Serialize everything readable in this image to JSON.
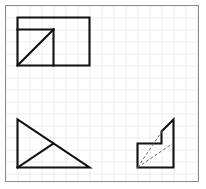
{
  "figure": {
    "canvas": {
      "width": 206,
      "height": 189,
      "background": "#ffffff"
    },
    "grid": {
      "visible": true,
      "cell_size": 12,
      "line_color": "#c9c9cf",
      "line_width": 0.7,
      "origin_x": 5.5,
      "origin_y": 5.5,
      "columns": 16,
      "rows": 14.5
    },
    "border": {
      "color": "#8a8a92",
      "width": 1,
      "x": 5.5,
      "y": 5.5,
      "w": 193,
      "h": 176
    },
    "stroke": {
      "color": "#111111",
      "width": 2.1,
      "dash_color": "#666666",
      "dash_width": 1,
      "dash_pattern": "3,2.2"
    },
    "shapes": [
      {
        "name": "rectangle-with-inner-square-and-diagonal",
        "position": "top-left",
        "outline": "17.5,17.5 89.5,17.5 89.5,65.5 17.5,65.5",
        "inner_lines": [
          {
            "name": "inner-square-top",
            "x1": 17.5,
            "y1": 29.5,
            "x2": 53.5,
            "y2": 29.5
          },
          {
            "name": "inner-square-right",
            "x1": 53.5,
            "y1": 29.5,
            "x2": 53.5,
            "y2": 65.5
          },
          {
            "name": "inner-square-diagonal",
            "x1": 17.5,
            "y1": 65.5,
            "x2": 53.5,
            "y2": 29.5
          }
        ]
      },
      {
        "name": "right-triangle-with-cevian",
        "position": "bottom-left",
        "outline": "17.5,119.5 17.5,167.5 89.5,167.5",
        "inner_lines": [
          {
            "name": "triangle-hypotenuse",
            "x1": 17.5,
            "y1": 119.5,
            "x2": 89.5,
            "y2": 167.5
          },
          {
            "name": "triangle-cevian",
            "x1": 17.5,
            "y1": 167.5,
            "x2": 53.5,
            "y2": 143.5
          }
        ]
      },
      {
        "name": "stepped-l-polygon-with-dashed-diagonals",
        "position": "bottom-right",
        "outline": "137.5,143.5 161.5,143.5 161.5,131.5 173.5,119.5 173.5,167.5 137.5,167.5",
        "dashed_lines": [
          {
            "name": "dashed-diagonal-to-step-top",
            "x1": 137.5,
            "y1": 167.5,
            "x2": 162.5,
            "y2": 130.5
          },
          {
            "name": "dashed-diagonal-to-step-corner",
            "x1": 137.5,
            "y1": 167.5,
            "x2": 172.5,
            "y2": 143.5
          }
        ]
      }
    ]
  }
}
